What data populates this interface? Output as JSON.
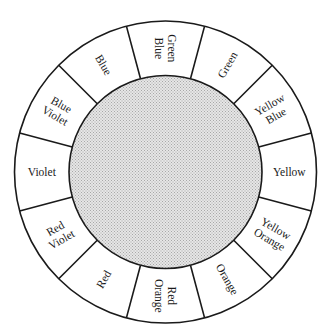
{
  "diagram": {
    "center": [
      165.5,
      172
    ],
    "outer_radius": 151,
    "inner_radius": 96.5,
    "line_color": "#1a1a1a",
    "inner_fill_base": "#e6e6e6",
    "inner_fill_dot": "#a8a8a8",
    "segments": [
      {
        "angle": 0,
        "lines": [
          "Yellow"
        ]
      },
      {
        "angle": 30,
        "lines": [
          "Yellow",
          "Orange"
        ]
      },
      {
        "angle": 60,
        "lines": [
          "Orange"
        ]
      },
      {
        "angle": 90,
        "lines": [
          "Red",
          "Orange"
        ]
      },
      {
        "angle": 120,
        "lines": [
          "Red"
        ]
      },
      {
        "angle": 150,
        "lines": [
          "Red",
          "Violet"
        ]
      },
      {
        "angle": 180,
        "lines": [
          "Violet"
        ]
      },
      {
        "angle": 210,
        "lines": [
          "Blue",
          "Violet"
        ]
      },
      {
        "angle": 240,
        "lines": [
          "Blue"
        ]
      },
      {
        "angle": 270,
        "lines": [
          "Green",
          "Blue"
        ]
      },
      {
        "angle": 300,
        "lines": [
          "Green"
        ]
      },
      {
        "angle": 330,
        "lines": [
          "Yellow",
          "Blue"
        ]
      }
    ]
  }
}
